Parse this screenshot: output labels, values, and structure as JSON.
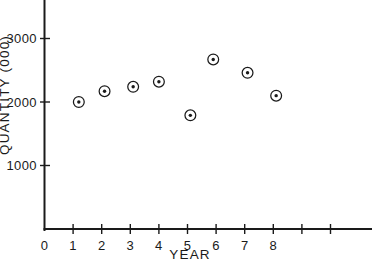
{
  "chart_data": {
    "type": "scatter",
    "title": "",
    "xlabel": "YEAR",
    "ylabel": "QUANTITY (000)",
    "x": [
      1.2,
      2.1,
      3.1,
      4.0,
      5.1,
      5.9,
      7.1,
      8.1
    ],
    "values": [
      2000,
      2170,
      2240,
      2320,
      1790,
      2670,
      2460,
      2100
    ],
    "points": [
      {
        "x": 1.2,
        "y": 2000
      },
      {
        "x": 2.1,
        "y": 2170
      },
      {
        "x": 3.1,
        "y": 2240
      },
      {
        "x": 4.0,
        "y": 2320
      },
      {
        "x": 5.1,
        "y": 1790
      },
      {
        "x": 5.9,
        "y": 2670
      },
      {
        "x": 7.1,
        "y": 2460
      },
      {
        "x": 8.1,
        "y": 2100
      }
    ],
    "xlim": [
      0,
      11.45
    ],
    "ylim": [
      0,
      3600
    ],
    "xticks": [
      0,
      1,
      2,
      3,
      4,
      5,
      6,
      7,
      8,
      9,
      10
    ],
    "xticklabels": [
      "0",
      "1",
      "2",
      "3",
      "4",
      "5",
      "6",
      "7",
      "8",
      "",
      ""
    ],
    "yticks": [
      1000,
      2000,
      3000
    ],
    "yticklabels": [
      "1000",
      "2000",
      "3000"
    ],
    "grid": false,
    "legend": null,
    "marker_style": "circle-with-center-dot",
    "colors": {
      "axis": "#1a1a1a",
      "marker": "#1a1a1a",
      "background": "#ffffff"
    }
  }
}
